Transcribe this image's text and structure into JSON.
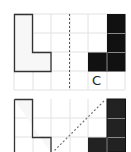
{
  "panels": [
    {
      "id": "top",
      "grid": {
        "cols": 6,
        "rows": 4,
        "origin": [
          14,
          14
        ],
        "cell": 18.5
      },
      "left_shape": {
        "type": "L-outline",
        "fill": "#f7f7f7",
        "stroke": "#333333"
      },
      "right_shape": {
        "type": "L-mirrored-filled",
        "fill": "#111111",
        "separator": "#888888"
      },
      "fold_line": {
        "style": "dashed",
        "orientation": "vertical",
        "color": "#555555"
      },
      "label": "C"
    },
    {
      "id": "bottom",
      "grid": {
        "cols": 6,
        "rows": 3,
        "origin": [
          14,
          99
        ],
        "cell": 18.5
      },
      "left_shape": {
        "type": "L-outline",
        "fill": "#f7f7f7",
        "stroke": "#333333"
      },
      "right_shape": {
        "type": "L-mirrored-filled",
        "fill": "#222222",
        "separator": "#888888"
      },
      "fold_line": {
        "style": "dashed",
        "orientation": "diagonal",
        "color": "#777777"
      }
    }
  ],
  "colors": {
    "grid": "#e2e2e2",
    "background": "#ffffff"
  }
}
